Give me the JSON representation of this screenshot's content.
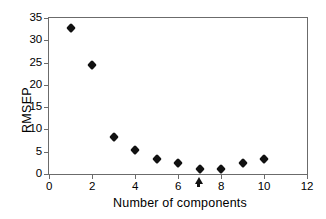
{
  "chart_data": {
    "type": "scatter",
    "title": "",
    "xlabel": "Number of components",
    "ylabel": "RMSEP",
    "xlim": [
      0,
      12
    ],
    "ylim": [
      0,
      35
    ],
    "xticks": [
      0,
      2,
      4,
      6,
      8,
      10,
      12
    ],
    "yticks": [
      0,
      5,
      10,
      15,
      20,
      25,
      30,
      35
    ],
    "grid": false,
    "legend": null,
    "marker": "diamond",
    "marker_color": "#111111",
    "axis_color": "#6b6b6b",
    "x": [
      1,
      2,
      3,
      4,
      5,
      6,
      7,
      8,
      9,
      10
    ],
    "values": [
      32.7,
      24.4,
      8.3,
      5.4,
      3.4,
      2.4,
      1.1,
      1.2,
      2.4,
      3.4
    ],
    "annotations": [
      {
        "name": "optimum-arrow",
        "x": 7,
        "y": 0,
        "symbol": "up-arrow",
        "text": ""
      }
    ]
  },
  "axis_titles": {
    "x": "Number of components",
    "y": "RMSEP"
  },
  "tick_labels": {
    "y": [
      "35",
      "30",
      "25",
      "20",
      "15",
      "10",
      "5",
      "0"
    ],
    "x": [
      "0",
      "2",
      "4",
      "6",
      "8",
      "10",
      "12"
    ]
  }
}
